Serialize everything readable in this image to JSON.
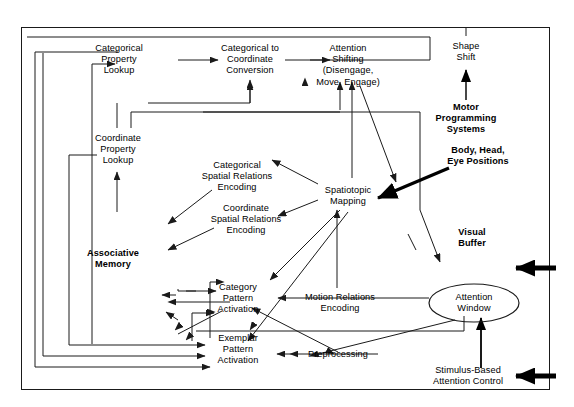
{
  "diagram": {
    "canvas": {
      "width": 574,
      "height": 407
    },
    "colors": {
      "stroke": "#1a1a1a",
      "text": "#000000",
      "background": "#ffffff"
    },
    "nodes": [
      {
        "id": "categorical-property-lookup",
        "label": "Categorical\nProperty\nLookup",
        "x": 119,
        "y": 60,
        "bold": false
      },
      {
        "id": "categorical-to-coordinate-conversion",
        "label": "Categorical to\nCoordinate\nConversion",
        "x": 250,
        "y": 60,
        "bold": false
      },
      {
        "id": "attention-shifting",
        "label": "Attention\nShifting\n(Disengage,\nMove, Engage)",
        "x": 348,
        "y": 60,
        "bold": false
      },
      {
        "id": "shape-shift",
        "label": "Shape\nShift",
        "x": 466,
        "y": 47,
        "bold": false
      },
      {
        "id": "motor-programming-systems",
        "label": "Motor\nProgramming\nSystems",
        "x": 466,
        "y": 113,
        "bold": true
      },
      {
        "id": "body-head-eye-positions",
        "label": "Body, Head,\nEye Positions",
        "x": 478,
        "y": 156,
        "bold": true
      },
      {
        "id": "coordinate-property-lookup",
        "label": "Coordinate\nProperty\nLookup",
        "x": 117,
        "y": 150,
        "bold": false
      },
      {
        "id": "categorical-spatial-relations-encoding",
        "label": "Categorical\nSpatial Relations\nEncoding",
        "x": 237,
        "y": 177,
        "bold": false
      },
      {
        "id": "coordinate-spatial-relations-encoding",
        "label": "Coordinate\nSpatial Relations\nEncoding",
        "x": 246,
        "y": 220,
        "bold": false
      },
      {
        "id": "spatiotopic-mapping",
        "label": "Spatiotopic\nMapping",
        "x": 348,
        "y": 196,
        "bold": false
      },
      {
        "id": "visual-buffer",
        "label": "Visual\nBuffer",
        "x": 472,
        "y": 238,
        "bold": true
      },
      {
        "id": "associative-memory",
        "label": "Associative\nMemory",
        "x": 113,
        "y": 259,
        "bold": true
      },
      {
        "id": "category-pattern-activation",
        "label": "Category\nPattern\nActivation",
        "x": 238,
        "y": 299,
        "bold": false
      },
      {
        "id": "motion-relations-encoding",
        "label": "Motion Relations\nEncoding",
        "x": 340,
        "y": 303,
        "bold": false
      },
      {
        "id": "attention-window",
        "label": "Attention\nWindow",
        "x": 474,
        "y": 303,
        "bold": false
      },
      {
        "id": "exemplar-pattern-activation",
        "label": "Exemplar\nPattern\nActivation",
        "x": 238,
        "y": 350,
        "bold": false
      },
      {
        "id": "preprocessing",
        "label": "Preprocessing",
        "x": 338,
        "y": 360,
        "bold": false
      },
      {
        "id": "stimulus-based-attention-control",
        "label": "Stimulus-Based\nAttention Control",
        "x": 468,
        "y": 376,
        "bold": false
      }
    ],
    "external_inputs": [
      {
        "id": "visual-buffer-input-arrow",
        "label": "",
        "x": 530,
        "y": 268
      },
      {
        "id": "attention-control-input-arrow",
        "label": "",
        "x": 530,
        "y": 376
      }
    ]
  }
}
